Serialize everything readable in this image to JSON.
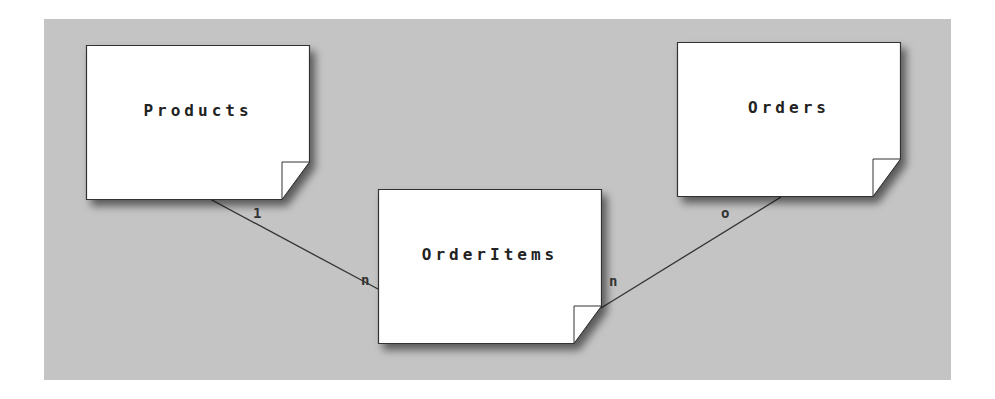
{
  "diagram": {
    "type": "entity-relationship",
    "background_color": "#c4c4c4",
    "entities": [
      {
        "id": "products",
        "label": "Products",
        "x": 86,
        "y": 45,
        "label_y": 56
      },
      {
        "id": "orders",
        "label": "Orders",
        "x": 677,
        "y": 42,
        "label_y": 55
      },
      {
        "id": "orderitems",
        "label": "OrderItems",
        "x": 378,
        "y": 189,
        "label_y": 55
      }
    ],
    "relationships": [
      {
        "from": "products",
        "to": "orderitems",
        "from_cardinality": "1",
        "to_cardinality": "n"
      },
      {
        "from": "orders",
        "to": "orderitems",
        "from_cardinality": "o",
        "to_cardinality": "n"
      }
    ]
  }
}
